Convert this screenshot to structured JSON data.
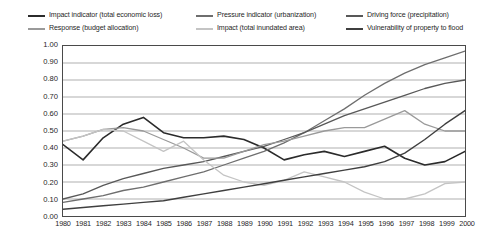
{
  "chart_data": {
    "type": "line",
    "title": "",
    "subtitle": "",
    "xlabel": "",
    "ylabel": "",
    "grid": true,
    "legend_position": "top",
    "xlim": [
      1980,
      2000
    ],
    "ylim": [
      0.0,
      1.0
    ],
    "y_ticks": [
      "0.00",
      "0.10",
      "0.20",
      "0.30",
      "0.40",
      "0.50",
      "0.60",
      "0.70",
      "0.80",
      "0.90",
      "1.00"
    ],
    "y_tick_values": [
      0.0,
      0.1,
      0.2,
      0.3,
      0.4,
      0.5,
      0.6,
      0.7,
      0.8,
      0.9,
      1.0
    ],
    "categories": [
      "1980",
      "1981",
      "1982",
      "1983",
      "1984",
      "1985",
      "1986",
      "1987",
      "1988",
      "1989",
      "1990",
      "1991",
      "1992",
      "1993",
      "1994",
      "1995",
      "1996",
      "1997",
      "1998",
      "1999",
      "2000"
    ],
    "x": [
      1980,
      1981,
      1982,
      1983,
      1984,
      1985,
      1986,
      1987,
      1988,
      1989,
      1990,
      1991,
      1992,
      1993,
      1994,
      1995,
      1996,
      1997,
      1998,
      1999,
      2000
    ],
    "series": [
      {
        "name": "Impact indicator (total economic loss)",
        "color": "#2b2b2b",
        "width": 1.6,
        "values": [
          0.42,
          0.33,
          0.46,
          0.54,
          0.58,
          0.49,
          0.46,
          0.46,
          0.47,
          0.45,
          0.4,
          0.33,
          0.36,
          0.38,
          0.35,
          0.38,
          0.41,
          0.34,
          0.3,
          0.32,
          0.38
        ]
      },
      {
        "name": "Pressure indicator (urbanization)",
        "color": "#6e6e6e",
        "width": 1.3,
        "values": [
          0.08,
          0.1,
          0.12,
          0.15,
          0.17,
          0.2,
          0.23,
          0.26,
          0.3,
          0.34,
          0.38,
          0.43,
          0.49,
          0.56,
          0.63,
          0.71,
          0.78,
          0.84,
          0.89,
          0.93,
          0.97
        ]
      },
      {
        "name": "Driving force (precipitation)",
        "color": "#585858",
        "width": 1.3,
        "values": [
          0.1,
          0.13,
          0.18,
          0.22,
          0.25,
          0.28,
          0.3,
          0.32,
          0.35,
          0.38,
          0.41,
          0.45,
          0.49,
          0.54,
          0.59,
          0.63,
          0.67,
          0.71,
          0.75,
          0.78,
          0.8
        ]
      },
      {
        "name": "Response (budget allocation)",
        "color": "#9a9a9a",
        "width": 1.3,
        "values": [
          0.44,
          0.47,
          0.51,
          0.52,
          0.5,
          0.45,
          0.4,
          0.34,
          0.34,
          0.38,
          0.42,
          0.44,
          0.47,
          0.5,
          0.52,
          0.52,
          0.57,
          0.62,
          0.54,
          0.5,
          0.5
        ]
      },
      {
        "name": "Impact (total inundated area)",
        "color": "#c4c4c4",
        "width": 1.3,
        "values": [
          0.44,
          0.47,
          0.51,
          0.5,
          0.44,
          0.38,
          0.44,
          0.33,
          0.24,
          0.2,
          0.18,
          0.21,
          0.26,
          0.23,
          0.2,
          0.14,
          0.1,
          0.1,
          0.13,
          0.19,
          0.2
        ]
      },
      {
        "name": "Vulnerability of property to flood",
        "color": "#3f3f3f",
        "width": 1.4,
        "values": [
          0.04,
          0.05,
          0.06,
          0.07,
          0.08,
          0.09,
          0.11,
          0.13,
          0.15,
          0.17,
          0.19,
          0.21,
          0.23,
          0.25,
          0.27,
          0.29,
          0.32,
          0.37,
          0.45,
          0.54,
          0.62
        ]
      }
    ]
  },
  "legend": {
    "entries": [
      {
        "label": "Impact indicator (total economic loss)",
        "color": "#2b2b2b"
      },
      {
        "label": "Pressure indicator (urbanization)",
        "color": "#6e6e6e"
      },
      {
        "label": "Driving force (precipitation)",
        "color": "#585858"
      },
      {
        "label": "Response (budget allocation)",
        "color": "#9a9a9a"
      },
      {
        "label": "Impact (total inundated area)",
        "color": "#c4c4c4"
      },
      {
        "label": "Vulnerability of property to flood",
        "color": "#3f3f3f"
      }
    ]
  },
  "axes": {
    "grid_color": "#8c8c8c",
    "frame_color": "#4a4a4a"
  }
}
